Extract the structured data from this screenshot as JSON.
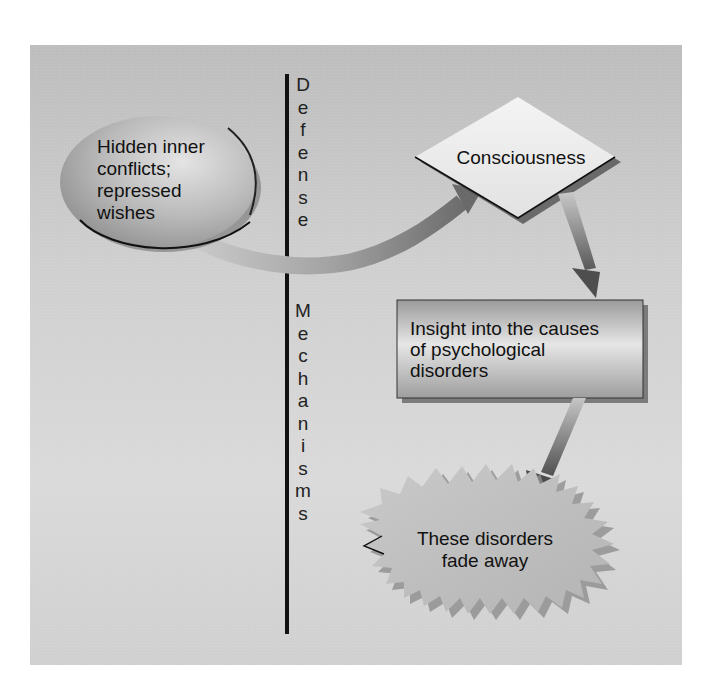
{
  "diagram": {
    "type": "flow",
    "divider_label_top": "Defense",
    "divider_label_bottom": "Mechanisms",
    "nodes": [
      {
        "id": "hidden",
        "shape": "ellipse",
        "lines": [
          "Hidden inner",
          "conflicts;",
          "repressed",
          "wishes"
        ]
      },
      {
        "id": "consciousness",
        "shape": "diamond",
        "lines": [
          "Consciousness"
        ]
      },
      {
        "id": "insight",
        "shape": "rectangle",
        "lines": [
          "Insight into the causes",
          "of psychological",
          "disorders"
        ]
      },
      {
        "id": "fade",
        "shape": "starburst",
        "lines": [
          "These disorders",
          "fade away"
        ]
      }
    ],
    "edges": [
      {
        "from": "hidden",
        "to": "consciousness",
        "crosses": "Defense Mechanisms divider"
      },
      {
        "from": "consciousness",
        "to": "insight"
      },
      {
        "from": "insight",
        "to": "fade"
      }
    ],
    "colors": {
      "background": "#cfcfcf",
      "divider": "#111111",
      "arrow_dark": "#6e6e6e",
      "arrow_light": "#c4c4c4",
      "text": "#111111"
    }
  },
  "text": {
    "hidden_1": "Hidden inner",
    "hidden_2": "conflicts;",
    "hidden_3": "repressed",
    "hidden_4": "wishes",
    "consciousness": "Consciousness",
    "insight_1": "Insight into the causes",
    "insight_2": "of psychological",
    "insight_3": "disorders",
    "fade_1": "These disorders",
    "fade_2": "fade away",
    "defense_letters": [
      "D",
      "e",
      "f",
      "e",
      "n",
      "s",
      "e"
    ],
    "mechanisms_letters": [
      "M",
      "e",
      "c",
      "h",
      "a",
      "n",
      "i",
      "s",
      "m",
      "s"
    ]
  }
}
